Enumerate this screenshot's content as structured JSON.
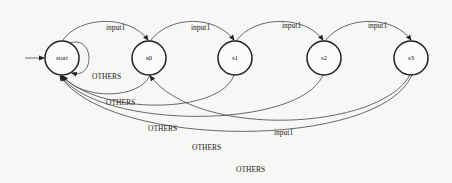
{
  "diagram": {
    "type": "state-machine",
    "nodes": [
      {
        "id": "start",
        "label": "start",
        "initial": true
      },
      {
        "id": "s0",
        "label": "s0"
      },
      {
        "id": "s1",
        "label": "s1"
      },
      {
        "id": "s2",
        "label": "s2"
      },
      {
        "id": "s3",
        "label": "s3"
      }
    ],
    "edges": [
      {
        "from": "start",
        "to": "start",
        "label": "OTHERS"
      },
      {
        "from": "start",
        "to": "s0",
        "label": "input1"
      },
      {
        "from": "s0",
        "to": "s1",
        "label": "input1"
      },
      {
        "from": "s1",
        "to": "s2",
        "label": "input1"
      },
      {
        "from": "s2",
        "to": "s3",
        "label": "input1"
      },
      {
        "from": "s0",
        "to": "start",
        "label": "OTHERS"
      },
      {
        "from": "s1",
        "to": "start",
        "label": "OTHERS"
      },
      {
        "from": "s2",
        "to": "start",
        "label": "OTHERS"
      },
      {
        "from": "s3",
        "to": "s0",
        "label": "input1"
      },
      {
        "from": "s3",
        "to": "start",
        "label": "OTHERS"
      }
    ],
    "labels": {
      "n_start": "start",
      "n_s0": "s0",
      "n_s1": "s1",
      "n_s2": "s2",
      "n_s3": "s3",
      "e_start_s0": "input1",
      "e_s0_s1": "input1",
      "e_s1_s2": "input1",
      "e_s2_s3": "input1",
      "e_self": "OTHERS",
      "e_s0_start": "OTHERS",
      "e_s1_start": "OTHERS",
      "e_s2_start": "OTHERS",
      "e_s3_s0": "input1",
      "e_s3_start": "OTHERS"
    }
  }
}
